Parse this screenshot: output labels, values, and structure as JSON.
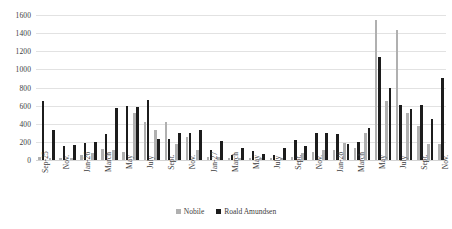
{
  "chart_data": {
    "type": "bar",
    "title": "",
    "subtitle": "",
    "xlabel": "",
    "ylabel": "",
    "ylim": [
      0,
      1600
    ],
    "ytick_step": 200,
    "yticks": [
      "0",
      "200",
      "400",
      "600",
      "800",
      "1000",
      "1200",
      "1400",
      "1600"
    ],
    "grid": true,
    "legend_position": "bottom",
    "colors": {
      "nobile": "#b0b0b0",
      "amundsen": "#1c1c1c",
      "gridline": "#e2e2e2",
      "text": "#3c3c3c",
      "background": "#ffffff"
    },
    "categories": [
      "Sep-25",
      "",
      "Nov.",
      "",
      "Jan-26",
      "",
      "March",
      "",
      "May",
      "",
      "July",
      "",
      "Sept.",
      "",
      "Nov.",
      "",
      "Jan-27",
      "",
      "March",
      "",
      "May",
      "",
      "July",
      "",
      "Sept.",
      "",
      "Nov.",
      "",
      "Jan-28",
      "",
      "March",
      "",
      "May",
      "",
      "July",
      "",
      "Sept.",
      "",
      "Nov."
    ],
    "tick_labels_visible": [
      "Sep-25",
      "Nov.",
      "Jan-26",
      "March",
      "May",
      "July",
      "Sept.",
      "Nov.",
      "Jan-27",
      "March",
      "May",
      "July",
      "Sept.",
      "Nov.",
      "Jan-28",
      "March",
      "May",
      "July",
      "Sept.",
      "Nov."
    ],
    "series": [
      {
        "name": "Nobile",
        "color": "#b0b0b0",
        "values": [
          30,
          20,
          20,
          20,
          60,
          80,
          120,
          110,
          90,
          520,
          420,
          330,
          420,
          180,
          250,
          110,
          30,
          30,
          20,
          20,
          20,
          20,
          20,
          20,
          30,
          80,
          90,
          110,
          110,
          190,
          130,
          300,
          1550,
          650,
          1430,
          520,
          380,
          180,
          180
        ]
      },
      {
        "name": "Roald Amundsen",
        "color": "#1c1c1c",
        "values": [
          650,
          330,
          160,
          170,
          190,
          200,
          290,
          570,
          600,
          590,
          660,
          230,
          230,
          300,
          300,
          330,
          110,
          210,
          60,
          130,
          100,
          70,
          50,
          130,
          220,
          150,
          300,
          300,
          290,
          180,
          200,
          350,
          1140,
          800,
          610,
          560,
          610,
          450,
          900
        ]
      }
    ]
  },
  "legend": {
    "entries": [
      {
        "label": "Nobile"
      },
      {
        "label": "Roald Amundsen"
      }
    ]
  }
}
